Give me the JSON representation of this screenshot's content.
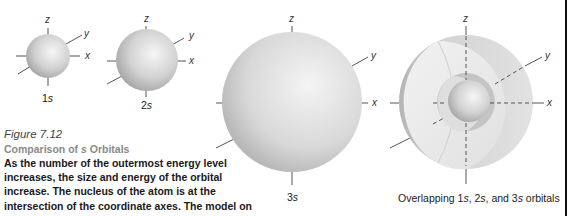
{
  "figure": {
    "number": "Figure 7.12",
    "title_prefix": "Comparison of ",
    "title_italic": "s",
    "title_suffix": " Orbitals",
    "body": "As the number of the outermost energy level increases, the size and energy of the orbital increase. The nucleus of the atom is at the intersection of the coordinate axes. The model on the right shows the overlap of the 1s, 2s, and"
  },
  "axes_labels": {
    "x": "x",
    "y": "y",
    "z": "z"
  },
  "orbitals": [
    {
      "name": "1s",
      "num": "1",
      "letter": "s"
    },
    {
      "name": "2s",
      "num": "2",
      "letter": "s"
    },
    {
      "name": "3s",
      "num": "3",
      "letter": "s"
    }
  ],
  "overlap": {
    "label": "Overlapping 1s, 2s, and 3s orbitals",
    "parts": [
      "Overlapping 1",
      "s",
      ", 2",
      "s",
      ", and 3",
      "s",
      " orbitals"
    ]
  },
  "colors": {
    "sphere_light": "#f4f4f4",
    "sphere_dark": "#9a9a9a",
    "axis": "#555555",
    "rule": "#111111"
  }
}
